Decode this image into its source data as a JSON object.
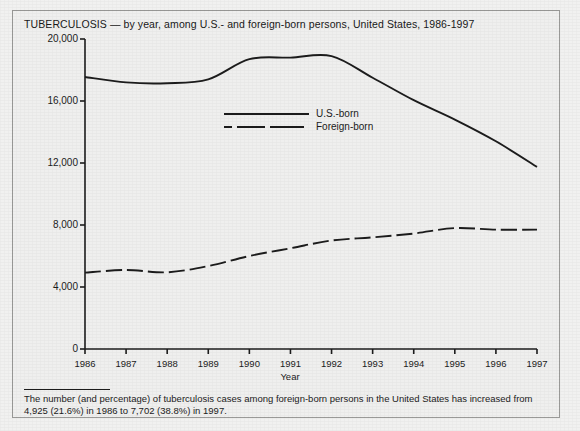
{
  "chart_data": {
    "type": "line",
    "title": "TUBERCULOSIS — by year, among U.S.- and foreign-born persons, United States, 1986-1997",
    "xlabel": "Year",
    "ylabel": "Reported Cases",
    "grid": false,
    "legend_position": "inside-upper-center",
    "x": [
      1986,
      1987,
      1988,
      1989,
      1990,
      1991,
      1992,
      1993,
      1994,
      1995,
      1996,
      1997
    ],
    "xtick_labels": [
      "1986",
      "1987",
      "1988",
      "1989",
      "1990",
      "1991",
      "1992",
      "1993",
      "1994",
      "1995",
      "1996",
      "1997"
    ],
    "ytick_labels": [
      "0",
      "4,000",
      "8,000",
      "12,000",
      "16,000",
      "20,000"
    ],
    "ytick_values": [
      0,
      4000,
      8000,
      12000,
      16000,
      20000
    ],
    "ylim": [
      0,
      20000
    ],
    "xlim": [
      1986,
      1997
    ],
    "series": [
      {
        "name": "U.S.-born",
        "style": "solid",
        "color": "#1c1c1c",
        "values": [
          17550,
          17200,
          17150,
          17400,
          18700,
          18800,
          18900,
          17500,
          16050,
          14800,
          13400,
          11750
        ]
      },
      {
        "name": "Foreign-born",
        "style": "dashed",
        "color": "#1c1c1c",
        "values": [
          4925,
          5100,
          4950,
          5350,
          6000,
          6500,
          7000,
          7200,
          7450,
          7800,
          7700,
          7702
        ]
      }
    ]
  },
  "legend": {
    "items": [
      {
        "label": "U.S.-born",
        "style": "solid"
      },
      {
        "label": "Foreign-born",
        "style": "dashed"
      }
    ]
  },
  "footnote": {
    "text": "The number (and percentage) of tuberculosis cases among foreign-born persons in the United States has increased from 4,925 (21.6%) in 1986 to 7,702 (38.8%) in 1997."
  }
}
